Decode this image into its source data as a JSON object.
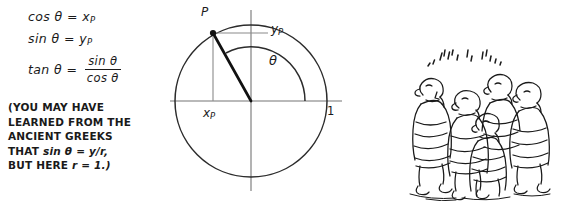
{
  "figure": {
    "background": "#ffffff",
    "ink": "#1a1a1a"
  },
  "equations": {
    "cos": {
      "lhs": "cos",
      "symbol": "θ",
      "eq": "=",
      "rhs_base": "x",
      "rhs_sub": "P"
    },
    "sin": {
      "lhs": "sin",
      "symbol": "θ",
      "eq": "=",
      "rhs_base": "y",
      "rhs_sub": "P"
    },
    "tan": {
      "lhs": "tan",
      "symbol": "θ",
      "eq": "=",
      "numerator": "sin θ",
      "denominator": "cos θ"
    }
  },
  "note": {
    "line1": "(YOU MAY HAVE",
    "line2": "LEARNED FROM THE",
    "line3": "ANCIENT GREEKS",
    "line4_pre": "THAT ",
    "line4_italic": "sin θ = y/r,",
    "line5_pre": "BUT HERE ",
    "line5_italic": "r = 1.)"
  },
  "diagram": {
    "type": "unit-circle",
    "center": {
      "x": 91,
      "y": 101
    },
    "radius": 76,
    "point_angle_deg": 118,
    "labels": {
      "point": "P",
      "y_base": "y",
      "y_sub": "P",
      "x_base": "x",
      "x_sub": "P",
      "angle": "θ",
      "radius_value": "1"
    },
    "axis_color": "#6e6e6e",
    "circle_color": "#2b2b2b",
    "radius_line_color": "#111111"
  },
  "cartoon": {
    "name": "ancient-greeks-crowd",
    "description": "Group of five robed ancient Greek figures with scribbled speech above",
    "figure_count": 5,
    "scribble": "illegible-greek-chatter"
  }
}
